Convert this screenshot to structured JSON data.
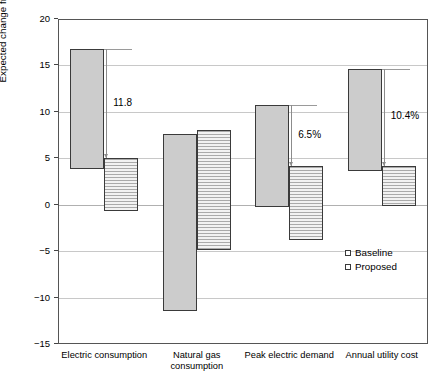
{
  "chart_data": {
    "type": "bar",
    "subtype": "floating-range-bar",
    "title": "",
    "xlabel": "",
    "ylabel": "Expected change from current climate (%)",
    "ylim": [
      -15,
      20
    ],
    "yticks": [
      20,
      15,
      10,
      5,
      0,
      -5,
      -10,
      -15
    ],
    "ytick_labels": [
      "20",
      "15",
      "10",
      "5",
      "0",
      "-5",
      "-10",
      "-15"
    ],
    "grid": true,
    "legend_position": "lower-right",
    "categories": [
      "Electric consumption",
      "Natural gas consumption",
      "Peak electric demand",
      "Annual utility cost"
    ],
    "series": [
      {
        "name": "Baseline",
        "fill": "solid-gray",
        "ranges": [
          {
            "low": 3.8,
            "high": 16.8
          },
          {
            "low": -11.4,
            "high": 7.6
          },
          {
            "low": -0.2,
            "high": 10.7
          },
          {
            "low": 3.6,
            "high": 14.6
          }
        ]
      },
      {
        "name": "Proposed",
        "fill": "horizontal-hatch",
        "ranges": [
          {
            "low": -0.7,
            "high": 5.0
          },
          {
            "low": -4.9,
            "high": 8.1
          },
          {
            "low": -3.8,
            "high": 4.2
          },
          {
            "low": -0.1,
            "high": 4.2
          }
        ]
      }
    ],
    "annotations": [
      {
        "category": "Electric consumption",
        "text": "11.8",
        "from": 16.8,
        "to": 5.0
      },
      {
        "category": "Peak electric demand",
        "text": "6.5%",
        "from": 10.7,
        "to": 4.2
      },
      {
        "category": "Annual utility cost",
        "text": "10.4%",
        "from": 14.6,
        "to": 4.2
      }
    ]
  },
  "legend": {
    "items": [
      {
        "label": "Baseline"
      },
      {
        "label": "Proposed"
      }
    ]
  },
  "colors": {
    "baseline_fill": "#cccccc",
    "proposed_hatch": "#aaaaaa",
    "bar_edge": "#3a3a3a",
    "grid": "#c8c8c8",
    "annotation": "#8c8c8c"
  }
}
